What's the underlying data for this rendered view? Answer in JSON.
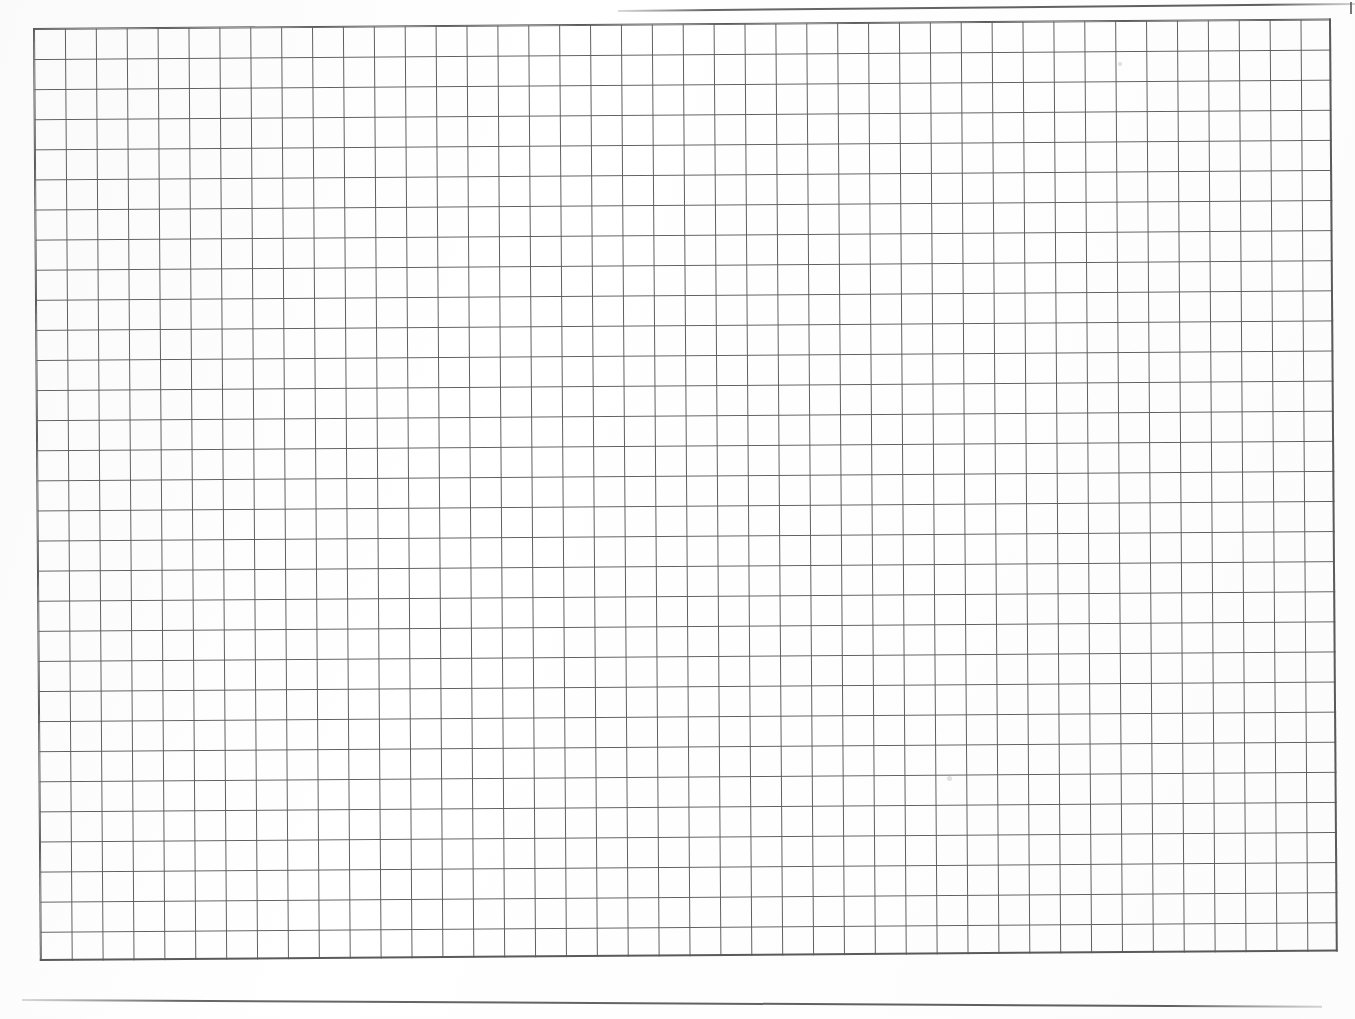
{
  "document": {
    "kind": "graph-paper-scan",
    "title": "Blank graph paper sheet",
    "caption": "",
    "page_width": 1355,
    "page_height": 1019,
    "background_color": "#fefefe"
  },
  "grid": {
    "name": "graph-grid",
    "columns": 42,
    "rows": 31,
    "cell_width": 30.9,
    "cell_height": 30.1,
    "line_color": "#5f5f5f",
    "line_width": 1.4,
    "border_color": "#5a5a5a",
    "origin_x": 33,
    "origin_y": 28,
    "rotation_deg": -0.42,
    "content": ""
  },
  "rules": [
    {
      "name": "top-rule-line",
      "x": 618,
      "y": 10,
      "length": 738,
      "angle_deg": -0.55,
      "color": "#5f5f5f"
    },
    {
      "name": "bottom-rule-line",
      "x": 22,
      "y": 999,
      "length": 1300,
      "angle_deg": 0.3,
      "color": "#5f5f5f"
    }
  ],
  "marks": [
    {
      "name": "paper-speck",
      "x": 947,
      "y": 776,
      "size": 5
    },
    {
      "name": "paper-speck",
      "x": 1118,
      "y": 62,
      "size": 4
    }
  ]
}
